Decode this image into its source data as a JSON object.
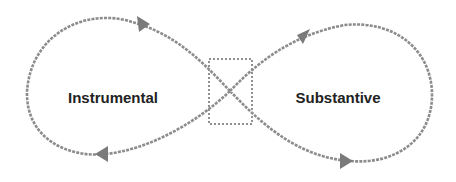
{
  "diagram": {
    "type": "figure-eight-cycle",
    "loops": [
      {
        "id": "left",
        "label": "Instrumental",
        "direction": "clockwise"
      },
      {
        "id": "right",
        "label": "Substantive",
        "direction": "counterclockwise"
      }
    ],
    "crossing": {
      "highlighted_by": "dotted-rectangle"
    }
  },
  "colors": {
    "curve": "#8c8c8c",
    "arrowhead": "#7a7a7a",
    "dotted_box": "#909090",
    "label_text": "#222222",
    "background": "#ffffff"
  }
}
